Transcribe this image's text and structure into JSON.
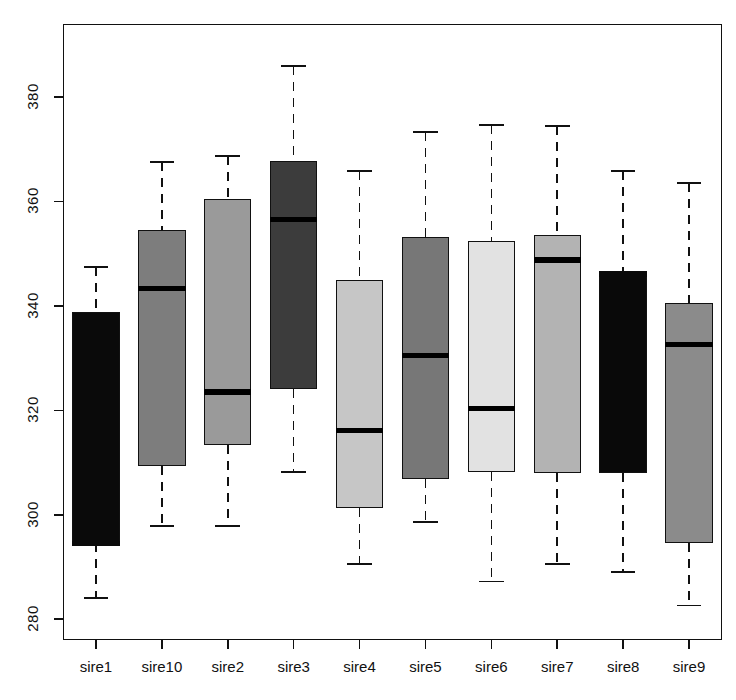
{
  "chart_data": {
    "type": "box",
    "title": "",
    "xlabel": "",
    "ylabel": "",
    "categories": [
      "sire1",
      "sire10",
      "sire2",
      "sire3",
      "sire4",
      "sire5",
      "sire6",
      "sire7",
      "sire8",
      "sire9"
    ],
    "ylim": [
      276,
      394
    ],
    "yticks": [
      280,
      300,
      320,
      340,
      360,
      380
    ],
    "ytick_labels": [
      "280",
      "300",
      "320",
      "340",
      "360",
      "380"
    ],
    "grid": false,
    "legend": false,
    "boxes": [
      {
        "name": "sire1",
        "whisker_low": 284.0,
        "q1": 294.5,
        "median": 294.5,
        "q3": 338.8,
        "whisker_high": 347.5,
        "fill": "#0a0a0a",
        "median_color": "#0a0a0a"
      },
      {
        "name": "sire10",
        "whisker_low": 297.8,
        "q1": 309.3,
        "median": 343.3,
        "q3": 354.5,
        "whisker_high": 367.6,
        "fill": "#7d7d7d",
        "median_color": "#000000"
      },
      {
        "name": "sire2",
        "whisker_low": 297.8,
        "q1": 313.3,
        "median": 323.5,
        "q3": 360.4,
        "whisker_high": 368.7,
        "fill": "#9a9a9a",
        "median_color": "#000000"
      },
      {
        "name": "sire3",
        "whisker_low": 308.2,
        "q1": 324.1,
        "median": 356.6,
        "q3": 367.8,
        "whisker_high": 386.0,
        "fill": "#3c3c3c",
        "median_color": "#000000"
      },
      {
        "name": "sire4",
        "whisker_low": 290.6,
        "q1": 301.3,
        "median": 316.1,
        "q3": 344.9,
        "whisker_high": 365.8,
        "fill": "#c6c6c6",
        "median_color": "#000000"
      },
      {
        "name": "sire5",
        "whisker_low": 298.6,
        "q1": 306.9,
        "median": 330.5,
        "q3": 353.2,
        "whisker_high": 373.3,
        "fill": "#777777",
        "median_color": "#000000"
      },
      {
        "name": "sire6",
        "whisker_low": 287.2,
        "q1": 308.2,
        "median": 320.4,
        "q3": 352.5,
        "whisker_high": 374.7,
        "fill": "#e2e2e2",
        "median_color": "#000000"
      },
      {
        "name": "sire7",
        "whisker_low": 290.6,
        "q1": 307.9,
        "median": 348.8,
        "q3": 353.6,
        "whisker_high": 374.5,
        "fill": "#b3b3b3",
        "median_color": "#000000"
      },
      {
        "name": "sire8",
        "whisker_low": 289.0,
        "q1": 307.9,
        "median": 346.1,
        "q3": 346.1,
        "whisker_high": 365.8,
        "fill": "#090909",
        "median_color": "#090909"
      },
      {
        "name": "sire9",
        "whisker_low": 282.6,
        "q1": 294.5,
        "median": 332.6,
        "q3": 340.5,
        "whisker_high": 363.5,
        "fill": "#8b8b8b",
        "median_color": "#000000"
      }
    ]
  },
  "axes": {
    "y_axis_name": "y-axis",
    "x_axis_name": "x-axis"
  }
}
